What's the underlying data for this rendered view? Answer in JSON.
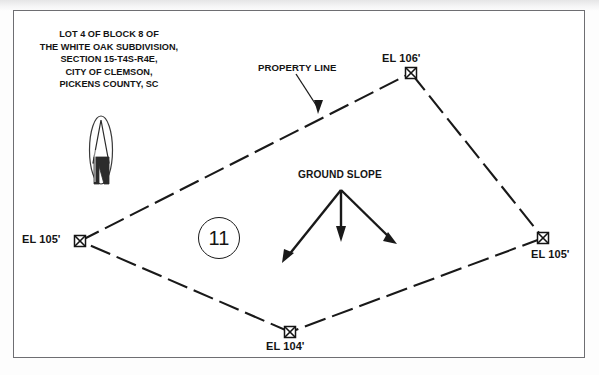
{
  "drawing": {
    "title_block": "LOT 4 OF BLOCK 8 OF\nTHE WHITE OAK SUBDIVISION,\nSECTION 15-T4S-R4E,\nCITY OF CLEMSON,\nPICKENS COUNTY, SC",
    "title_lines": [
      "LOT 4 OF BLOCK 8 OF",
      "THE WHITE OAK SUBDIVISION,",
      "SECTION 15-T4S-R4E,",
      "CITY OF CLEMSON,",
      "PICKENS COUNTY, SC"
    ],
    "lot_number": "11",
    "annotations": {
      "property_line": "PROPERTY LINE",
      "ground_slope": "GROUND SLOPE"
    },
    "north_arrow": "N",
    "corners": [
      {
        "name": "north",
        "label": "EL 106'",
        "elevation": 106,
        "x": 411,
        "y": 73
      },
      {
        "name": "east",
        "label": "EL 105'",
        "elevation": 105,
        "x": 543,
        "y": 238
      },
      {
        "name": "south",
        "label": "EL 104'",
        "elevation": 104,
        "x": 290,
        "y": 332
      },
      {
        "name": "west",
        "label": "EL 105'",
        "elevation": 105,
        "x": 80,
        "y": 241
      }
    ],
    "colors": {
      "ink": "#141414",
      "frame": "#6e6e72",
      "paper": "#ffffff"
    }
  }
}
